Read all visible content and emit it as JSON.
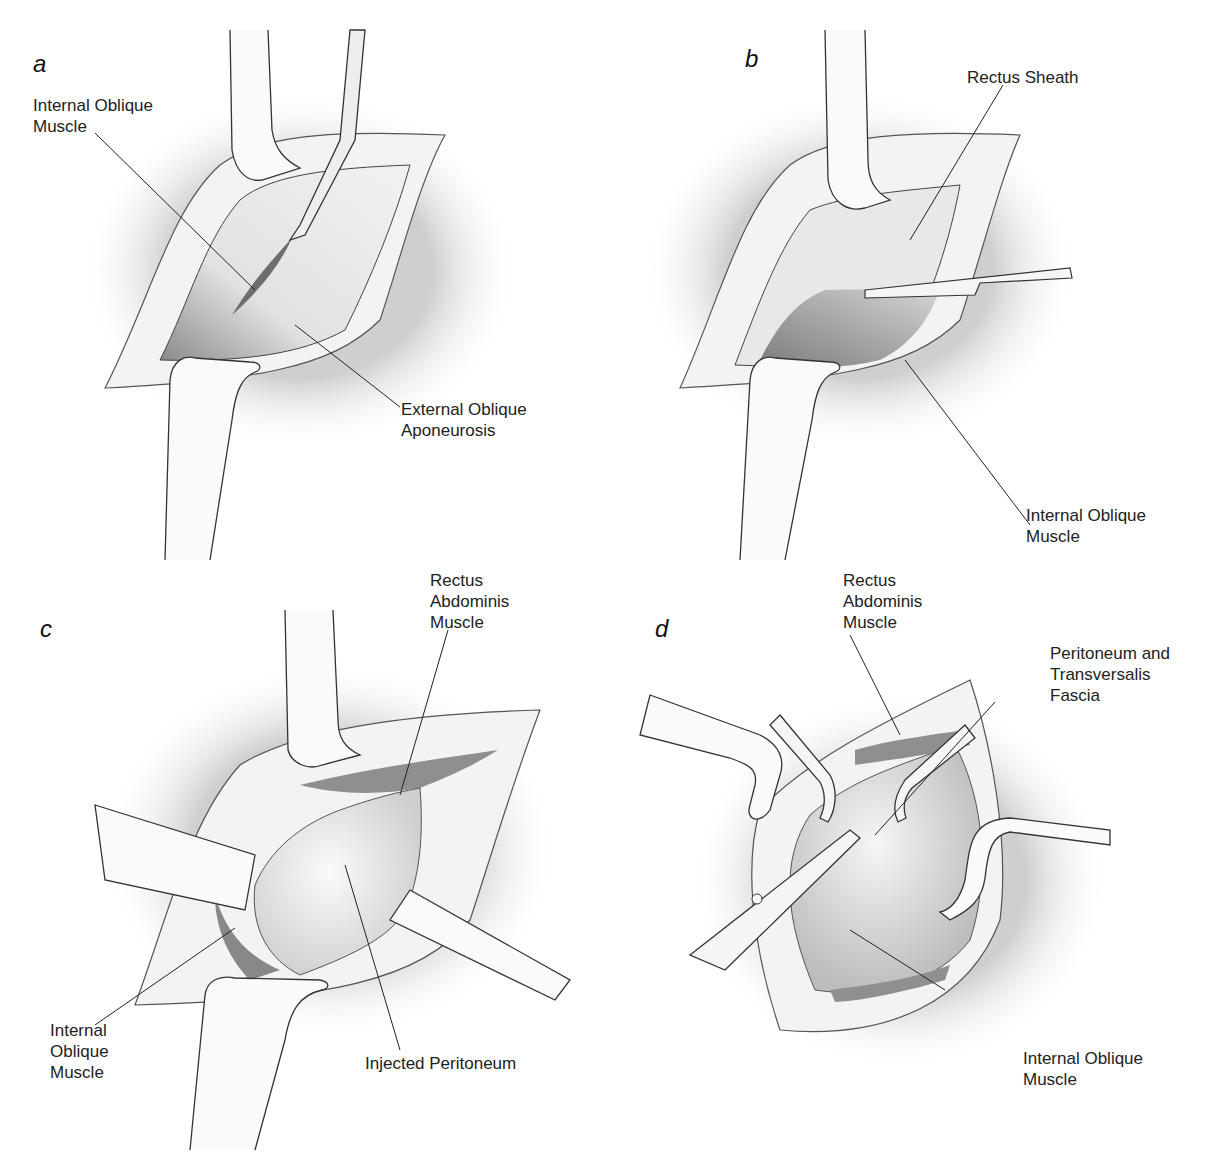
{
  "figure": {
    "colors": {
      "background": "#ffffff",
      "line": "#222222",
      "tissue": "#e4e4e4",
      "muscle": "#9a9a9a",
      "fat": "#f2f2f2"
    }
  },
  "panels": [
    {
      "letter": "a",
      "labels": [
        {
          "text": "Internal Oblique\nMuscle"
        },
        {
          "text": "External Oblique\nAponeurosis"
        }
      ],
      "instruments": [
        "retractor-top",
        "scalpel",
        "retractor-bottom"
      ]
    },
    {
      "letter": "b",
      "labels": [
        {
          "text": "Rectus Sheath"
        },
        {
          "text": "Internal Oblique\nMuscle"
        }
      ],
      "instruments": [
        "retractor-top",
        "forceps",
        "retractor-bottom"
      ]
    },
    {
      "letter": "c",
      "labels": [
        {
          "text": "Rectus\nAbdominis\nMuscle"
        },
        {
          "text": "Internal\nOblique\nMuscle"
        },
        {
          "text": "Injected Peritoneum"
        }
      ],
      "instruments": [
        "retractor-top",
        "retractor-left",
        "retractor-right",
        "retractor-bottom"
      ]
    },
    {
      "letter": "d",
      "labels": [
        {
          "text": "Rectus\nAbdominis\nMuscle"
        },
        {
          "text": "Peritoneum and\nTransversalis\nFascia"
        },
        {
          "text": "Internal Oblique\nMuscle"
        }
      ],
      "instruments": [
        "retractor-left",
        "clamp-left",
        "clamp-right",
        "retractor-right",
        "scissors"
      ]
    }
  ]
}
